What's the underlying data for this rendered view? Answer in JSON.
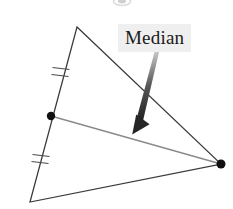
{
  "figure": {
    "type": "geometry-diagram",
    "background_color": "#ffffff",
    "width": 233,
    "height": 209
  },
  "annotation": {
    "label_text": "Median",
    "label_background_color": "#efefef",
    "label_text_color": "#1a1a1a",
    "label_x": 118,
    "label_y": 24,
    "label_width": 88,
    "label_height": 26
  },
  "arrow": {
    "name": "median-pointer-arrow",
    "start_x": 157,
    "start_y": 50,
    "tip_x": 133,
    "tip_y": 133,
    "color_dark": "#2b2b2b",
    "color_light": "#c9c9c9",
    "description": "tapered gradient arrow pointing down-left to the median segment"
  },
  "triangle": {
    "name": "triangle",
    "stroke_color": "#3a3a3a",
    "stroke_width": 1.2,
    "vertices": [
      {
        "name": "apex",
        "x": 77,
        "y": 27
      },
      {
        "name": "bottom-left",
        "x": 30,
        "y": 202
      },
      {
        "name": "right",
        "x": 221,
        "y": 164
      }
    ]
  },
  "median": {
    "name": "median-segment",
    "stroke_color": "#8a8a8a",
    "stroke_width": 1.3,
    "from_x": 51,
    "from_y": 116,
    "to_x": 221,
    "to_y": 164
  },
  "points": [
    {
      "name": "midpoint-dot",
      "x": 51,
      "y": 116,
      "r": 4.2,
      "color": "#111111"
    },
    {
      "name": "vertex-dot",
      "x": 221,
      "y": 164,
      "r": 4.5,
      "color": "#111111"
    }
  ],
  "tick_marks": [
    {
      "name": "upper-congruence-ticks",
      "count": 2,
      "center_x": 61,
      "center_y": 72,
      "color": "#4a4a4a",
      "meaning": "equal segment marker"
    },
    {
      "name": "lower-congruence-ticks",
      "count": 2,
      "center_x": 41,
      "center_y": 159,
      "color": "#4a4a4a",
      "meaning": "equal segment marker"
    }
  ],
  "artifact": {
    "name": "cropped-glyph-artifact",
    "x": 113,
    "y": 0,
    "width": 18,
    "height": 6,
    "color": "#d8d8d8"
  }
}
